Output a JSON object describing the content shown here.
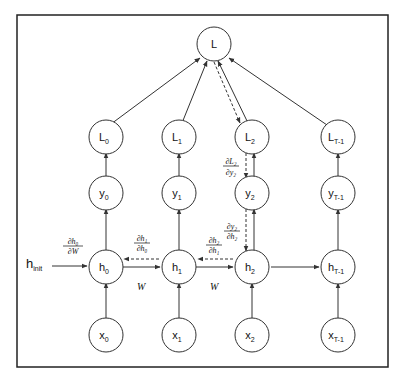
{
  "diagram": {
    "loss_node": {
      "label": "L"
    },
    "loss_nodes": [
      {
        "base": "L",
        "sub": "0"
      },
      {
        "base": "L",
        "sub": "1"
      },
      {
        "base": "L",
        "sub": "2"
      },
      {
        "base": "L",
        "sub": "T-1"
      }
    ],
    "output_nodes": [
      {
        "base": "y",
        "sub": "0"
      },
      {
        "base": "y",
        "sub": "1"
      },
      {
        "base": "y",
        "sub": "2"
      },
      {
        "base": "y",
        "sub": "T-1"
      }
    ],
    "hidden_nodes": [
      {
        "base": "h",
        "sub": "0"
      },
      {
        "base": "h",
        "sub": "1"
      },
      {
        "base": "h",
        "sub": "2"
      },
      {
        "base": "h",
        "sub": "T-1"
      }
    ],
    "input_nodes": [
      {
        "base": "x",
        "sub": "0"
      },
      {
        "base": "x",
        "sub": "1"
      },
      {
        "base": "x",
        "sub": "2"
      },
      {
        "base": "x",
        "sub": "T-1"
      }
    ],
    "h_init": {
      "base": "h",
      "sub": "init"
    },
    "weight_labels": [
      "W",
      "W"
    ],
    "gradients": {
      "dh0_dW": {
        "num": "∂h₀",
        "den": "∂W"
      },
      "dh1_dh0": {
        "num": "∂h₁",
        "den": "∂h₀"
      },
      "dh2_dh1": {
        "num": "∂h₂",
        "den": "∂h₁"
      },
      "dy2_dh2": {
        "num": "∂y₂",
        "den": "∂h₂"
      },
      "dL2_dy2": {
        "num": "∂L₂",
        "den": "∂y₂"
      }
    },
    "colors": {
      "stroke": "#333333",
      "text": "#111111",
      "background": "#ffffff"
    }
  }
}
